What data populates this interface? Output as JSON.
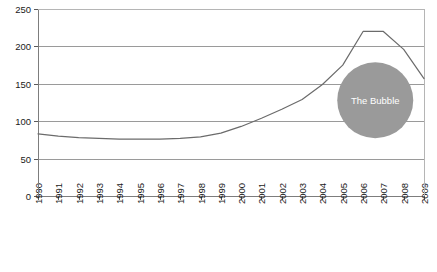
{
  "chart_data": {
    "type": "line",
    "title": "",
    "xlabel": "",
    "ylabel": "",
    "ylim": [
      0,
      250
    ],
    "yticks": [
      0,
      50,
      100,
      150,
      200,
      250
    ],
    "grid": true,
    "legend": "none",
    "categories": [
      "1990",
      "1991",
      "1992",
      "1993",
      "1994",
      "1995",
      "1996",
      "1997",
      "1998",
      "1999",
      "2000",
      "2001",
      "2002",
      "2003",
      "2004",
      "2005",
      "2006",
      "2007",
      "2008",
      "2009"
    ],
    "series": [
      {
        "name": "Index",
        "color": "#6b6b6b",
        "values": [
          83,
          80,
          78,
          77,
          76,
          76,
          76,
          77,
          79,
          84,
          93,
          104,
          116,
          129,
          149,
          175,
          220,
          220,
          196,
          157
        ]
      }
    ],
    "annotations": [
      {
        "name": "the-bubble",
        "text": "The Bubble",
        "shape": "circle",
        "color": "#9a9a9a",
        "text_color": "#ffffff",
        "center_x_year": 2006.6,
        "center_y_value": 128,
        "radius_px": 38
      }
    ]
  }
}
